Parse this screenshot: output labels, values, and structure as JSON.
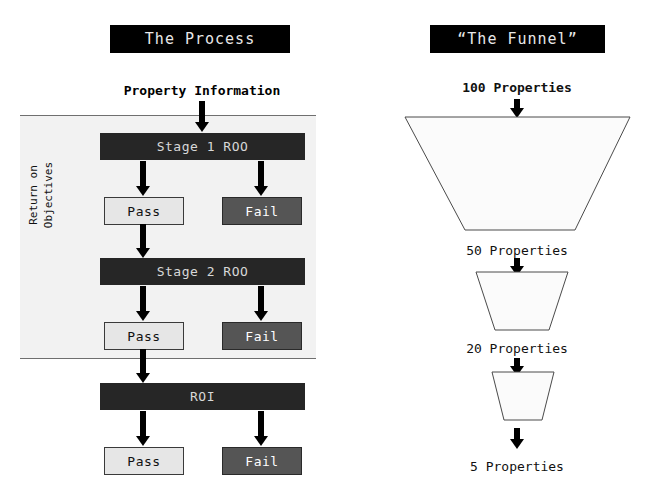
{
  "left_panel": {
    "banner_title": "The Process",
    "input_label": "Property Information",
    "axis_label_line1": "Return on",
    "axis_label_line2": "Objectives",
    "stages": [
      {
        "name": "Stage 1 ROO",
        "pass_label": "Pass",
        "fail_label": "Fail"
      },
      {
        "name": "Stage 2 ROO",
        "pass_label": "Pass",
        "fail_label": "Fail"
      },
      {
        "name": "ROI",
        "pass_label": "Pass",
        "fail_label": "Fail"
      }
    ]
  },
  "right_panel": {
    "banner_title": "“The Funnel”",
    "steps": [
      {
        "label": "100 Properties"
      },
      {
        "label": "50 Properties"
      },
      {
        "label": "20 Properties"
      },
      {
        "label": "5 Properties"
      }
    ]
  },
  "colors": {
    "banner_background": "#000000",
    "banner_text": "#e8e8e8",
    "stage_bar_background": "#262626",
    "stage_bar_text": "#d8d8d8",
    "pass_background": "#e6e6e6",
    "fail_background": "#555555",
    "band_background": "#f2f2f2",
    "arrow": "#000000",
    "funnel_fill": "#fbfbfb",
    "funnel_stroke": "#4a4a4a"
  }
}
